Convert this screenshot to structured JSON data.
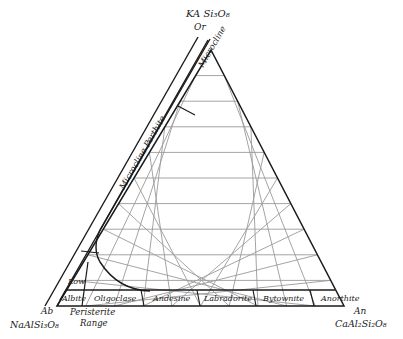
{
  "diagram": {
    "type": "ternary-feldspar",
    "apex_top": {
      "formula": "KAlSi3O8",
      "formula_display": "KA Si₃O₈",
      "abbr": "Or"
    },
    "vertex_left": {
      "formula_display": "NaAlSi₃O₈",
      "abbr": "Ab"
    },
    "vertex_right": {
      "formula_display": "CaAl₂Si₂O₈",
      "abbr": "An"
    },
    "alkali_series": {
      "microcline": "Microcline",
      "microcline_perthite": "Microcline Perthite"
    },
    "plagioclase_series": [
      {
        "name": "Low Albite",
        "line1": "Low",
        "line2": "Albite"
      },
      {
        "name": "Oligoclase"
      },
      {
        "name": "Andesine"
      },
      {
        "name": "Labradorite"
      },
      {
        "name": "Bytownite"
      },
      {
        "name": "Anorthite"
      }
    ],
    "peristerite": {
      "line1": "Peristerite",
      "line2": "Range"
    },
    "grid_divisions": 10,
    "colors": {
      "outline": "#1a1a1a",
      "grid": "#9a9a9a",
      "background": "#ffffff"
    }
  }
}
